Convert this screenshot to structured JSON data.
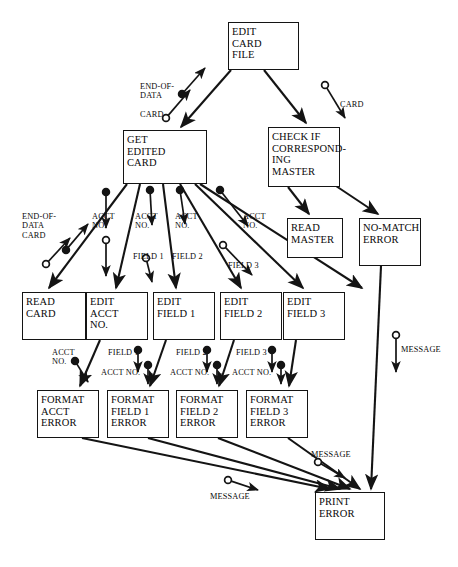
{
  "diagram": {
    "type": "structure-chart",
    "canvas": {
      "width": 458,
      "height": 567
    },
    "colors": {
      "line": "#141414",
      "text": "#0a0a0a",
      "background": "#ffffff"
    },
    "nodes": [
      {
        "id": "edit-card-file",
        "label": "EDIT\nCARD\nFILE",
        "x": 228,
        "y": 22,
        "w": 71,
        "h": 48
      },
      {
        "id": "get-edited-card",
        "label": "GET\nEDITED\nCARD",
        "x": 123,
        "y": 130,
        "w": 84,
        "h": 54
      },
      {
        "id": "check-master",
        "label": "CHECK IF\nCORRESPOND-\nING\nMASTER",
        "x": 268,
        "y": 127,
        "w": 72,
        "h": 60
      },
      {
        "id": "read-master",
        "label": "READ\nMASTER",
        "x": 287,
        "y": 218,
        "w": 56,
        "h": 40
      },
      {
        "id": "no-match-error",
        "label": "NO-MATCH\nERROR",
        "x": 359,
        "y": 218,
        "w": 62,
        "h": 48
      },
      {
        "id": "read-card",
        "label": "READ\nCARD",
        "x": 22,
        "y": 292,
        "w": 64,
        "h": 48
      },
      {
        "id": "edit-acct-no",
        "label": "EDIT\nACCT\nNO.",
        "x": 86,
        "y": 292,
        "w": 62,
        "h": 48
      },
      {
        "id": "edit-field-1",
        "label": "EDIT\nFIELD 1",
        "x": 153,
        "y": 292,
        "w": 62,
        "h": 48
      },
      {
        "id": "edit-field-2",
        "label": "EDIT\nFIELD 2",
        "x": 220,
        "y": 292,
        "w": 62,
        "h": 48
      },
      {
        "id": "edit-field-3",
        "label": "EDIT\nFIELD 3",
        "x": 283,
        "y": 292,
        "w": 62,
        "h": 48
      },
      {
        "id": "format-acct-err",
        "label": "FORMAT\nACCT\nERROR",
        "x": 37,
        "y": 390,
        "w": 62,
        "h": 48
      },
      {
        "id": "format-f1-err",
        "label": "FORMAT\nFIELD 1\nERROR",
        "x": 107,
        "y": 390,
        "w": 62,
        "h": 48
      },
      {
        "id": "format-f2-err",
        "label": "FORMAT\nFIELD 2\nERROR",
        "x": 176,
        "y": 390,
        "w": 62,
        "h": 48
      },
      {
        "id": "format-f3-err",
        "label": "FORMAT\nFIELD 3\nERROR",
        "x": 246,
        "y": 390,
        "w": 62,
        "h": 48
      },
      {
        "id": "print-error",
        "label": "PRINT\nERROR",
        "x": 315,
        "y": 492,
        "w": 70,
        "h": 48
      }
    ],
    "edge_labels": [
      {
        "id": "lbl-end-of-data-card-top",
        "text": "END-OF-\nDATA\n\nCARD",
        "x": 140,
        "y": 82
      },
      {
        "id": "lbl-card-right",
        "text": "CARD",
        "x": 340,
        "y": 100
      },
      {
        "id": "lbl-end-of-data-card-left",
        "text": "END-OF-\nDATA\nCARD",
        "x": 22,
        "y": 212
      },
      {
        "id": "lbl-acct-no-1",
        "text": "ACCT\nNO.",
        "x": 92,
        "y": 212
      },
      {
        "id": "lbl-acct-no-2",
        "text": "ACCT\nNO.",
        "x": 135,
        "y": 212
      },
      {
        "id": "lbl-acct-no-3",
        "text": "ACCT\nNO.",
        "x": 175,
        "y": 212
      },
      {
        "id": "lbl-acct-no-4",
        "text": "ACCT\nNO.",
        "x": 243,
        "y": 212
      },
      {
        "id": "lbl-field-1-top",
        "text": "FIELD 1",
        "x": 133,
        "y": 252
      },
      {
        "id": "lbl-field-2-top",
        "text": "FIELD 2",
        "x": 172,
        "y": 252
      },
      {
        "id": "lbl-field-3-top",
        "text": "FIELD 3",
        "x": 228,
        "y": 261
      },
      {
        "id": "lbl-acct-no-fmt",
        "text": "ACCT\nNO.",
        "x": 52,
        "y": 348
      },
      {
        "id": "lbl-field-1-fmt",
        "text": "FIELD 1",
        "x": 108,
        "y": 348
      },
      {
        "id": "lbl-acct-no-fmt-1",
        "text": "ACCT NO.",
        "x": 101,
        "y": 368
      },
      {
        "id": "lbl-field-2-fmt",
        "text": "FIELD 2",
        "x": 176,
        "y": 348
      },
      {
        "id": "lbl-acct-no-fmt-2",
        "text": "ACCT NO.",
        "x": 170,
        "y": 368
      },
      {
        "id": "lbl-field-3-fmt",
        "text": "FIELD 3",
        "x": 236,
        "y": 348
      },
      {
        "id": "lbl-acct-no-fmt-3",
        "text": "ACCT NO.",
        "x": 232,
        "y": 368
      },
      {
        "id": "lbl-message-right",
        "text": "MESSAGE",
        "x": 401,
        "y": 345
      },
      {
        "id": "lbl-message-mid",
        "text": "MESSAGE",
        "x": 311,
        "y": 450
      },
      {
        "id": "lbl-message-left",
        "text": "MESSAGE",
        "x": 210,
        "y": 492
      }
    ],
    "edges": [
      {
        "id": "e-ecf-gec",
        "from": "edit-card-file",
        "to": "get-edited-card",
        "path": "M 231,70 L 181,127",
        "arrow": "end"
      },
      {
        "id": "e-ecf-chk",
        "from": "edit-card-file",
        "to": "check-master",
        "path": "M 264,70 L 306,123",
        "arrow": "end"
      },
      {
        "id": "e-chk-rm",
        "from": "check-master",
        "to": "read-master",
        "path": "M 288,187 L 309,214",
        "arrow": "end"
      },
      {
        "id": "e-chk-nme",
        "from": "check-master",
        "to": "no-match-error",
        "path": "M 336,186 L 378,214",
        "arrow": "end"
      },
      {
        "id": "e-gec-rc",
        "from": "get-edited-card",
        "to": "read-card",
        "path": "M 127,184 L 49,288",
        "arrow": "end"
      },
      {
        "id": "e-gec-ean",
        "from": "get-edited-card",
        "to": "edit-acct-no",
        "path": "M 140,184 L 116,288",
        "arrow": "end"
      },
      {
        "id": "e-gec-ef1",
        "from": "get-edited-card",
        "to": "edit-field-1",
        "path": "M 163,184 L 176,288",
        "arrow": "end"
      },
      {
        "id": "e-gec-ef2",
        "from": "get-edited-card",
        "to": "edit-field-2",
        "path": "M 180,184 L 241,288",
        "arrow": "end"
      },
      {
        "id": "e-gec-ef3",
        "from": "get-edited-card",
        "to": "edit-field-3",
        "path": "M 195,184 L 303,288",
        "arrow": "end"
      },
      {
        "id": "e-gec-nme",
        "from": "get-edited-card",
        "to": "no-match-error",
        "path": "M 200,184 L 362,288",
        "arrow": "end"
      },
      {
        "id": "e-ean-fae",
        "from": "edit-acct-no",
        "to": "format-acct-err",
        "path": "M 100,340 L 80,386",
        "arrow": "end"
      },
      {
        "id": "e-ef1-ff1",
        "from": "edit-field-1",
        "to": "format-f1-err",
        "path": "M 166,340 L 150,386",
        "arrow": "end"
      },
      {
        "id": "e-ef2-ff2",
        "from": "edit-field-2",
        "to": "format-f2-err",
        "path": "M 234,340 L 219,386",
        "arrow": "end"
      },
      {
        "id": "e-ef3-ff3",
        "from": "edit-field-3",
        "to": "format-f3-err",
        "path": "M 296,340 L 289,386",
        "arrow": "end"
      },
      {
        "id": "e-fae-pe",
        "from": "format-acct-err",
        "to": "print-error",
        "path": "M 82,438 L 330,489",
        "arrow": "end"
      },
      {
        "id": "e-ff1-pe",
        "from": "format-f1-err",
        "to": "print-error",
        "path": "M 148,438 L 340,489",
        "arrow": "end"
      },
      {
        "id": "e-ff2-pe",
        "from": "format-f2-err",
        "to": "print-error",
        "path": "M 218,438 L 350,489",
        "arrow": "end"
      },
      {
        "id": "e-ff3-pe",
        "from": "format-f3-err",
        "to": "print-error",
        "path": "M 288,438 L 360,489",
        "arrow": "end"
      },
      {
        "id": "e-nme-pe",
        "from": "no-match-error",
        "to": "print-error",
        "path": "M 381,266 L 371,489",
        "arrow": "end"
      }
    ],
    "couples": [
      {
        "id": "c-end-of-data",
        "kind": "data",
        "marker": "filled",
        "path": "M 182,94 L 205,68",
        "label_ref": "lbl-end-of-data-card-top"
      },
      {
        "id": "c-card-top",
        "kind": "control",
        "marker": "open",
        "path": "M 166,118 L 190,90",
        "label_ref": "lbl-end-of-data-card-top"
      },
      {
        "id": "c-card-right",
        "kind": "control",
        "marker": "open",
        "path": "M 325,85 L 345,118",
        "label_ref": "lbl-card-right"
      },
      {
        "id": "c-eod-left",
        "kind": "data",
        "marker": "filled",
        "path": "M 66,250 L 88,224",
        "label_ref": "lbl-end-of-data-card-left"
      },
      {
        "id": "c-card-left",
        "kind": "control",
        "marker": "open",
        "path": "M 46,264 L 70,238",
        "label_ref": "lbl-end-of-data-card-left"
      },
      {
        "id": "c-acct-1",
        "kind": "data",
        "marker": "filled",
        "path": "M 106,192 L 106,228",
        "label_ref": "lbl-acct-no-1"
      },
      {
        "id": "c-acct-2",
        "kind": "data",
        "marker": "filled",
        "path": "M 150,190 L 152,225",
        "label_ref": "lbl-acct-no-2"
      },
      {
        "id": "c-acct-3",
        "kind": "data",
        "marker": "filled",
        "path": "M 180,190 L 185,224",
        "label_ref": "lbl-acct-no-3"
      },
      {
        "id": "c-acct-4",
        "kind": "data",
        "marker": "filled",
        "path": "M 220,190 L 248,226",
        "label_ref": "lbl-acct-no-4"
      },
      {
        "id": "c-field-1",
        "kind": "data",
        "marker": "open",
        "path": "M 106,240 L 106,276",
        "label_ref": "lbl-field-1-top"
      },
      {
        "id": "c-field-2",
        "kind": "open2",
        "marker": "open",
        "path": "M 146,258 L 152,282",
        "label_ref": "lbl-field-2-top"
      },
      {
        "id": "c-field-3",
        "kind": "open3",
        "marker": "open",
        "path": "M 223,245 L 252,275",
        "label_ref": "lbl-field-3-top"
      },
      {
        "id": "c-acct-fmt",
        "kind": "data",
        "marker": "filled",
        "path": "M 75,361 L 88,382",
        "label_ref": "lbl-acct-no-fmt"
      },
      {
        "id": "c-f1-fmt",
        "kind": "data",
        "marker": "filled",
        "path": "M 138,350 L 138,372",
        "label_ref": "lbl-field-1-fmt"
      },
      {
        "id": "c-acct-fmt-1",
        "kind": "data",
        "marker": "filled",
        "path": "M 148,365 L 148,384",
        "label_ref": "lbl-acct-no-fmt-1"
      },
      {
        "id": "c-f2-fmt",
        "kind": "data",
        "marker": "filled",
        "path": "M 207,350 L 207,372",
        "label_ref": "lbl-field-2-fmt"
      },
      {
        "id": "c-acct-fmt-2",
        "kind": "data",
        "marker": "filled",
        "path": "M 217,365 L 217,384",
        "label_ref": "lbl-acct-no-fmt-2"
      },
      {
        "id": "c-f3-fmt",
        "kind": "data",
        "marker": "filled",
        "path": "M 272,350 L 272,372",
        "label_ref": "lbl-field-3-fmt"
      },
      {
        "id": "c-acct-fmt-3",
        "kind": "data",
        "marker": "filled",
        "path": "M 281,365 L 281,384",
        "label_ref": "lbl-acct-no-fmt-3"
      },
      {
        "id": "c-msg-right",
        "kind": "control",
        "marker": "open",
        "path": "M 396,335 L 396,372",
        "label_ref": "lbl-message-right"
      },
      {
        "id": "c-msg-mid",
        "kind": "control",
        "marker": "open",
        "path": "M 318,462 L 345,478",
        "label_ref": "lbl-message-mid"
      },
      {
        "id": "c-msg-left",
        "kind": "control",
        "marker": "open",
        "path": "M 228,480 L 258,490",
        "label_ref": "lbl-message-left"
      }
    ]
  }
}
